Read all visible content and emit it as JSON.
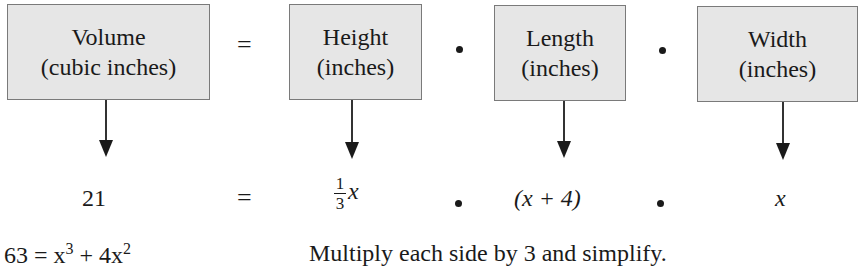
{
  "boxes": [
    {
      "line1": "Volume",
      "line2": "(cubic inches)"
    },
    {
      "line1": "Height",
      "line2": "(inches)"
    },
    {
      "line1": "Length",
      "line2": "(inches)"
    },
    {
      "line1": "Width",
      "line2": "(inches)"
    }
  ],
  "operators": {
    "equals": "=",
    "times": "•"
  },
  "values": {
    "volume": "21",
    "height_num": "1",
    "height_den": "3",
    "height_var": "x",
    "length": "(x + 4)",
    "width": "x"
  },
  "bottom_line": {
    "equation_lhs": "63 = x",
    "exp1": "3",
    "equation_mid": " + 4x",
    "exp2": "2",
    "note": "Multiply each side by 3 and simplify."
  },
  "colors": {
    "box_fill": "#e6e6e6",
    "box_border": "#7a7a7a",
    "text": "#1a1a1a"
  }
}
